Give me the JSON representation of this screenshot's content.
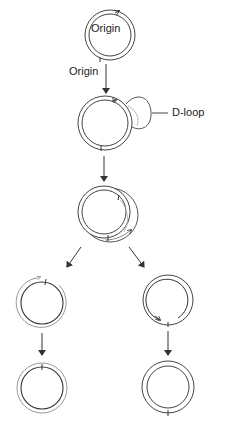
{
  "diagram": {
    "labels": {
      "origin_inner": "Origin",
      "origin_outer": "Origin",
      "dloop": "D-loop"
    },
    "stages": [
      {
        "id": "parent",
        "description": "Circular double-stranded DNA with origin"
      },
      {
        "id": "dloop",
        "description": "D-loop formation at origin"
      },
      {
        "id": "elongation",
        "description": "Strand displacement elongation"
      },
      {
        "id": "daughter-left",
        "description": "Displaced strand molecule"
      },
      {
        "id": "daughter-right",
        "description": "Parental-strand molecule with new strand synthesis"
      },
      {
        "id": "final-left",
        "description": "Completed daughter molecule"
      },
      {
        "id": "final-right",
        "description": "Completed daughter molecule"
      }
    ],
    "colors": {
      "strand_dark": "#333333",
      "strand_light": "#9a9a9a",
      "background": "#ffffff"
    }
  }
}
